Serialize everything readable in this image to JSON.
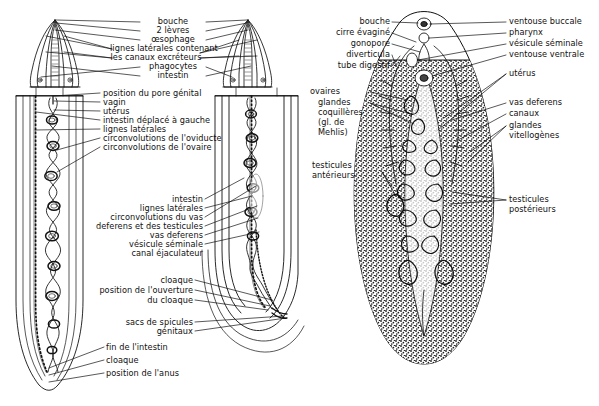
{
  "figure": {
    "title": "",
    "type": "biological-anatomy-diagram",
    "language": "fr",
    "panels": [
      {
        "id": "left",
        "name": "nematode-pair",
        "description": "Nematode female (left) and male (right), anterior segments above and body segments below"
      },
      {
        "id": "right",
        "name": "trematode",
        "description": "Trematode (douve) whole body, ventral view"
      }
    ]
  },
  "left_panel": {
    "anterior_labels": [
      {
        "text": "bouche",
        "side": "center"
      },
      {
        "text": "2 lèvres",
        "side": "center"
      },
      {
        "text": "œsophage",
        "side": "center"
      },
      {
        "text": "lignes latérales contenant",
        "side": "center"
      },
      {
        "text": "les canaux excréteurs",
        "side": "center"
      },
      {
        "text": "phagocytes",
        "side": "center"
      },
      {
        "text": "intestin",
        "side": "center"
      }
    ],
    "female_labels": [
      {
        "text": "position du pore génital"
      },
      {
        "text": "vagin"
      },
      {
        "text": "utérus"
      },
      {
        "text": "intestin déplacé à gauche"
      },
      {
        "text": "lignes latérales"
      },
      {
        "text": "circonvolutions de l'oviducte"
      },
      {
        "text": "circonvolutions de l'ovaire"
      }
    ],
    "male_labels": [
      {
        "text": "intestin"
      },
      {
        "text": "lignes latérales"
      },
      {
        "text": "circonvolutions du vas"
      },
      {
        "text": "deferens et des testicules"
      },
      {
        "text": "vas deferens"
      },
      {
        "text": "vésicule séminale"
      },
      {
        "text": "canal éjaculateur"
      },
      {
        "text": "cloaque"
      },
      {
        "text": "position de l'ouverture"
      },
      {
        "text": "du cloaque"
      },
      {
        "text": "sacs de spicules"
      },
      {
        "text": "génitaux"
      }
    ],
    "tail_labels": [
      {
        "text": "fin de l'intestin"
      },
      {
        "text": "cloaque"
      },
      {
        "text": "position de l'anus"
      }
    ]
  },
  "right_panel": {
    "left_labels": [
      {
        "text": "bouche"
      },
      {
        "text": "cirre évaginé"
      },
      {
        "text": "gonopore"
      },
      {
        "text": "diverticula"
      },
      {
        "text": "tube digestif"
      },
      {
        "text": "ovaires"
      },
      {
        "text": "glandes"
      },
      {
        "text": "coquillères"
      },
      {
        "text": "(gl. de"
      },
      {
        "text": "Mehlis)"
      },
      {
        "text": "testicules"
      },
      {
        "text": "antérieurs"
      }
    ],
    "right_labels": [
      {
        "text": "ventouse buccale"
      },
      {
        "text": "pharynx"
      },
      {
        "text": "vésicule séminale"
      },
      {
        "text": "ventouse ventrale"
      },
      {
        "text": "utérus"
      },
      {
        "text": "vas deferens"
      },
      {
        "text": "canaux"
      },
      {
        "text": "glandes"
      },
      {
        "text": "vitellogènes"
      },
      {
        "text": "testicules"
      },
      {
        "text": "postérieurs"
      }
    ]
  },
  "colors": {
    "ink": "#111111",
    "background": "#ffffff",
    "stipple": "#1a1a1a"
  }
}
